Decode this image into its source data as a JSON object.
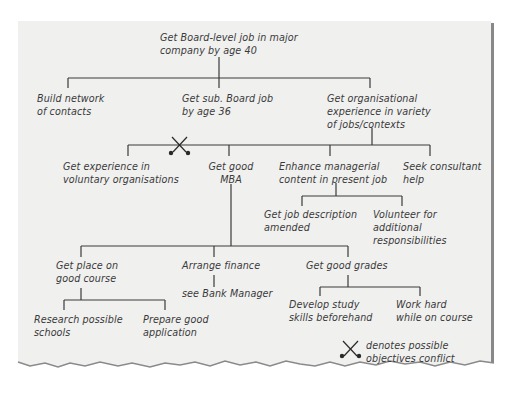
{
  "diagram": {
    "type": "objectives-tree",
    "root": {
      "lines": [
        "Get Board-level job in major",
        "company by age 40"
      ]
    },
    "level1": [
      {
        "id": "network",
        "lines": [
          "Build network",
          "of contacts"
        ]
      },
      {
        "id": "subboard",
        "lines": [
          "Get sub. Board job",
          "by age 36"
        ]
      },
      {
        "id": "orgexp",
        "lines": [
          "Get organisational",
          "experience in variety",
          "of jobs/contexts"
        ]
      }
    ],
    "level2": [
      {
        "id": "voluntary",
        "lines": [
          "Get experience in",
          "voluntary organisations"
        ]
      },
      {
        "id": "mba",
        "lines": [
          "Get good",
          "MBA"
        ]
      },
      {
        "id": "enhance",
        "lines": [
          "Enhance managerial",
          "content in present job"
        ]
      },
      {
        "id": "consultant",
        "lines": [
          "Seek consultant",
          "help"
        ]
      }
    ],
    "enhance_children": [
      {
        "id": "jobdesc",
        "lines": [
          "Get job description",
          "amended"
        ]
      },
      {
        "id": "volunteer",
        "lines": [
          "Volunteer for",
          "additional",
          "responsibilities"
        ]
      }
    ],
    "mba_children": [
      {
        "id": "place",
        "lines": [
          "Get place on",
          "good course"
        ]
      },
      {
        "id": "finance",
        "lines": [
          "Arrange finance"
        ]
      },
      {
        "id": "grades",
        "lines": [
          "Get good grades"
        ]
      }
    ],
    "place_children": [
      {
        "id": "research",
        "lines": [
          "Research possible",
          "schools"
        ]
      },
      {
        "id": "prepare",
        "lines": [
          "Prepare good",
          "application"
        ]
      }
    ],
    "finance_children": [
      {
        "id": "bank",
        "lines": [
          "see Bank Manager"
        ]
      }
    ],
    "grades_children": [
      {
        "id": "study",
        "lines": [
          "Develop study",
          "skills beforehand"
        ]
      },
      {
        "id": "workhard",
        "lines": [
          "Work hard",
          "while on course"
        ]
      }
    ],
    "legend": {
      "icon": "crossed-swords-icon",
      "lines": [
        "denotes possible",
        "objectives conflict"
      ]
    },
    "conflict_marker": {
      "between": [
        "voluntary",
        "mba"
      ]
    }
  }
}
